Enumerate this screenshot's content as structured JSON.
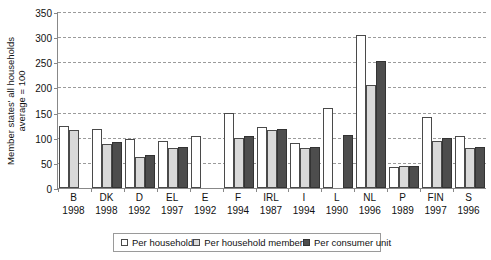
{
  "chart_data": {
    "type": "bar",
    "title": "",
    "xlabel": "",
    "ylabel": "Member states' all households\naverage = 100",
    "ylim": [
      0,
      350
    ],
    "ytick_step": 50,
    "yticks": [
      350,
      300,
      250,
      200,
      150,
      100,
      50,
      0
    ],
    "grid": true,
    "legend_position": "bottom",
    "categories": [
      "B",
      "DK",
      "D",
      "EL",
      "E",
      "F",
      "IRL",
      "I",
      "L",
      "NL",
      "P",
      "FIN",
      "S"
    ],
    "years": [
      "1998",
      "1998",
      "1992",
      "1997",
      "1992",
      "1994",
      "1987",
      "1994",
      "1990",
      "1996",
      "1989",
      "1997",
      "1996"
    ],
    "series": [
      {
        "name": "Per household",
        "color": "#ffffff",
        "values": [
          123,
          117,
          98,
          93,
          103,
          150,
          122,
          90,
          160,
          305,
          42,
          142,
          103
        ]
      },
      {
        "name": "Per household member",
        "color": "#d9d9d9",
        "values": [
          116,
          87,
          62,
          80,
          null,
          100,
          115,
          80,
          null,
          205,
          43,
          94,
          80
        ]
      },
      {
        "name": "Per consumer unit",
        "color": "#4d4d4d",
        "values": [
          null,
          92,
          66,
          82,
          null,
          103,
          118,
          82,
          105,
          252,
          44,
          99,
          82
        ]
      }
    ]
  },
  "colors": {
    "axis": "#888888",
    "grid": "#9b9b9b",
    "bar_outline": "#4a4a4a",
    "series_0": "#ffffff",
    "series_1": "#d9d9d9",
    "series_2": "#4d4d4d"
  }
}
